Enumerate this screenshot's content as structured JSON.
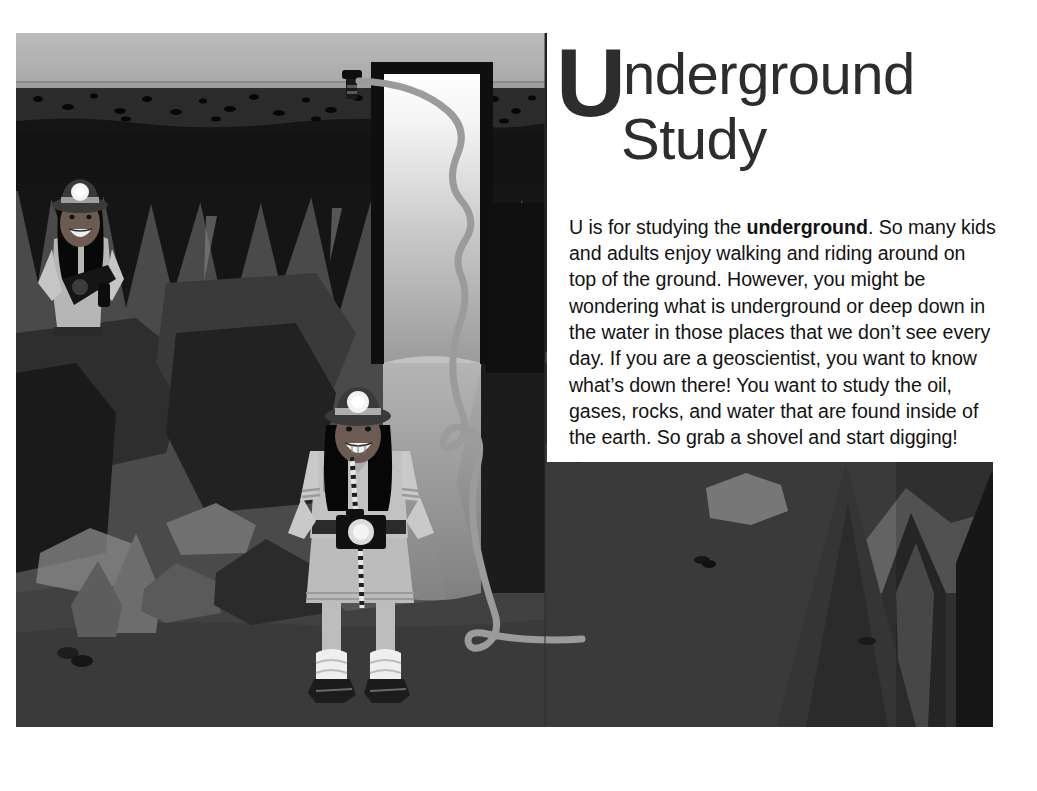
{
  "page": {
    "background_color": "#ffffff",
    "width": 1037,
    "height": 791
  },
  "heading": {
    "dropcap": "U",
    "line1_rest": "nderground",
    "line2": "Study",
    "color": "#2d2d2d"
  },
  "body": {
    "part1": "U is for studying the ",
    "bold": "underground",
    "part2": ".  So many kids and adults enjoy walking and riding around on top of the ground.  However, you might be wondering what is underground or deep down in the water in those places that we don’t see every day. If you are a geoscientist, you want to know what’s down there! You want to study the oil, gases, rocks, and water that are found inside of the earth. So grab a shovel and start digging!",
    "color": "#121212"
  },
  "illustration": {
    "alt": "Cross-section of the underground: a cave with stalactites and stalagmites, two geoscientists wearing hard hats with headlamps, a well shaft with a cable descending from a surface wellhead.",
    "palette": {
      "sky": "#b4b4b4",
      "soil": "#2c2c2c",
      "soil_dark": "#1b1b1b",
      "bedrock": "#1a1a1a",
      "cave_wall": "#4a4a4a",
      "cave_dark": "#242424",
      "cave_darker": "#141414",
      "rock_light": "#6e6e6e",
      "rock_mid": "#565656",
      "shaft_light": "#ffffff",
      "shaft_dark": "#9d9d9d",
      "cable": "#8f8f8f",
      "frame": "#111111",
      "skin": "#6a5a52",
      "uniform": "#a9a9a9",
      "hat": "#3a3a3a",
      "lamp": "#f2f2f2",
      "hair": "#0a0a0a",
      "boot": "#1c1c1c"
    },
    "elements": [
      "sky",
      "topsoil-layer",
      "bedrock-layer",
      "cave-ceiling",
      "stalactites",
      "stalagmites",
      "well-shaft",
      "well-frame",
      "wellhead-pump",
      "descending-cable",
      "geoscientist-left",
      "geoscientist-center",
      "boulders",
      "pebbles"
    ]
  }
}
